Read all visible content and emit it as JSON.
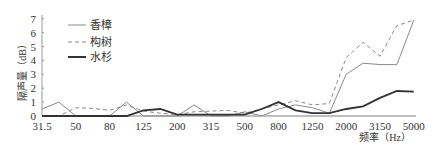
{
  "chart_data": {
    "type": "line",
    "title": "",
    "xlabel": "频率（Hz）",
    "ylabel": "隔声量（dB）",
    "ylim": [
      0,
      7
    ],
    "yticks": [
      0,
      1,
      2,
      3,
      4,
      5,
      6,
      7
    ],
    "x": [
      "31.5",
      "40",
      "50",
      "63",
      "80",
      "100",
      "125",
      "160",
      "200",
      "250",
      "315",
      "400",
      "500",
      "630",
      "800",
      "1000",
      "1250",
      "1600",
      "2000",
      "2500",
      "3150",
      "4000",
      "5000"
    ],
    "xtick_labels": [
      "31.5",
      "50",
      "80",
      "125",
      "200",
      "315",
      "500",
      "800",
      "1250",
      "2000",
      "3150",
      "5000"
    ],
    "grid": false,
    "legend_position": "upper-left",
    "series": [
      {
        "name": "香樟",
        "style": "thin-solid",
        "color": "#8a8a8a",
        "values": [
          0.5,
          1.0,
          0.0,
          0.0,
          0.0,
          1.0,
          0.0,
          0.0,
          0.0,
          0.8,
          0.0,
          0.0,
          0.3,
          0.0,
          0.5,
          0.8,
          0.6,
          0.2,
          3.0,
          3.8,
          3.7,
          3.7,
          6.9
        ]
      },
      {
        "name": "构树",
        "style": "dashed",
        "color": "#8a8a8a",
        "values": [
          0.0,
          0.0,
          0.6,
          0.55,
          0.4,
          0.8,
          0.35,
          0.2,
          0.1,
          0.3,
          0.35,
          0.4,
          0.2,
          0.5,
          0.8,
          1.1,
          0.8,
          0.9,
          4.2,
          5.3,
          4.3,
          6.5,
          6.9
        ]
      },
      {
        "name": "水杉",
        "style": "thick-solid",
        "color": "#333333",
        "values": [
          0.0,
          0.0,
          0.0,
          0.0,
          0.0,
          0.0,
          0.4,
          0.5,
          0.1,
          0.1,
          0.1,
          0.1,
          0.1,
          0.5,
          1.0,
          0.4,
          0.2,
          0.2,
          0.5,
          0.7,
          1.3,
          1.8,
          1.75
        ]
      }
    ]
  },
  "legend": {
    "items": [
      {
        "label": "香樟"
      },
      {
        "label": "构树"
      },
      {
        "label": "水杉"
      }
    ]
  },
  "axes": {
    "xlabel": "频率（Hz）",
    "ylabel": "隔声量（dB）"
  }
}
